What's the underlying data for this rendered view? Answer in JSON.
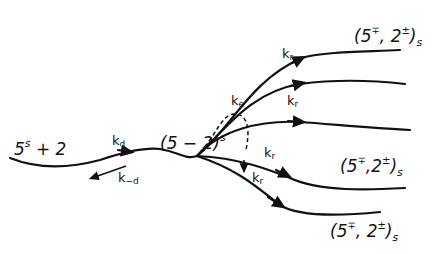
{
  "diagram": {
    "reactant": {
      "base": "5",
      "sup": "s",
      "rest": " + 2"
    },
    "intermediate": {
      "text": "(5 − 2)",
      "sup": "s"
    },
    "rates": {
      "kd": {
        "k": "k",
        "sub": "d"
      },
      "k_minus_d": {
        "k": "k",
        "sub": "−d"
      },
      "ke": {
        "k": "k",
        "sub": "e"
      },
      "kr": {
        "k": "k",
        "sub": "r"
      }
    },
    "products": [
      {
        "open": "(5",
        "sup1": "∓",
        "mid": ", 2",
        "sup2": "±",
        "close": ")",
        "sub": "s"
      },
      {
        "open": "(5",
        "sup1": "∓",
        "mid": ",2",
        "sup2": "±",
        "close": ")",
        "sub": "s"
      },
      {
        "open": "(5",
        "sup1": "∓",
        "mid": ", 2",
        "sup2": "±",
        "close": ")",
        "sub": "s"
      }
    ]
  }
}
